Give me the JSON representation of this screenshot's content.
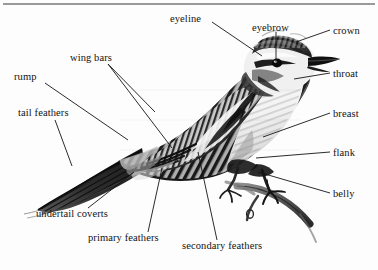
{
  "diagram": {
    "background_color": "#fdfdfd",
    "ink_color": "#131313",
    "top_rule_color": "#9a9a9a",
    "labels": [
      {
        "id": "eyeline",
        "text": "eyeline",
        "x": 170,
        "y": 13,
        "align": "left"
      },
      {
        "id": "eyebrow",
        "text": "eyebrow",
        "x": 252,
        "y": 22,
        "align": "left"
      },
      {
        "id": "crown",
        "text": "crown",
        "x": 333,
        "y": 33,
        "align": "left"
      },
      {
        "id": "throat",
        "text": "throat",
        "x": 333,
        "y": 76,
        "align": "left"
      },
      {
        "id": "breast",
        "text": "breast",
        "x": 333,
        "y": 116,
        "align": "left"
      },
      {
        "id": "flank",
        "text": "flank",
        "x": 333,
        "y": 155,
        "align": "left"
      },
      {
        "id": "belly",
        "text": "belly",
        "x": 333,
        "y": 196,
        "align": "left"
      },
      {
        "id": "wing-bars",
        "text": "wing bars",
        "x": 70,
        "y": 58,
        "align": "left"
      },
      {
        "id": "rump",
        "text": "rump",
        "x": 14,
        "y": 77,
        "align": "left"
      },
      {
        "id": "tail-feathers",
        "text": "tail feathers",
        "x": 18,
        "y": 113,
        "align": "left"
      },
      {
        "id": "undertail-coverts",
        "text": "undertail coverts",
        "x": 36,
        "y": 214,
        "align": "left"
      },
      {
        "id": "primary-feathers",
        "text": "primary feathers",
        "x": 88,
        "y": 238,
        "align": "left"
      },
      {
        "id": "secondary-feathers",
        "text": "secondary feathers",
        "x": 182,
        "y": 246,
        "align": "left"
      }
    ],
    "leader_lines": [
      {
        "id": "leader-eyeline",
        "from": [
          212,
          22
        ],
        "to": [
          262,
          56
        ]
      },
      {
        "id": "leader-eyebrow",
        "from": [
          276,
          32
        ],
        "to": [
          276,
          62
        ]
      },
      {
        "id": "leader-crown",
        "from": [
          330,
          30
        ],
        "to": [
          296,
          42
        ]
      },
      {
        "id": "leader-throat",
        "from": [
          330,
          73
        ],
        "to": [
          294,
          79
        ]
      },
      {
        "id": "leader-breast",
        "from": [
          330,
          113
        ],
        "to": [
          263,
          137
        ]
      },
      {
        "id": "leader-flank",
        "from": [
          330,
          152
        ],
        "to": [
          256,
          158
        ]
      },
      {
        "id": "leader-belly",
        "from": [
          330,
          193
        ],
        "to": [
          258,
          172
        ]
      },
      {
        "id": "leader-wing-bars-a",
        "from": [
          108,
          64
        ],
        "to": [
          155,
          112
        ]
      },
      {
        "id": "leader-wing-bars-b",
        "from": [
          108,
          64
        ],
        "to": [
          172,
          148
        ]
      },
      {
        "id": "leader-rump",
        "from": [
          45,
          83
        ],
        "to": [
          128,
          140
        ]
      },
      {
        "id": "leader-tail-feathers",
        "from": [
          55,
          120
        ],
        "to": [
          72,
          166
        ]
      },
      {
        "id": "leader-undertail-coverts",
        "from": [
          88,
          208
        ],
        "to": [
          134,
          172
        ]
      },
      {
        "id": "leader-primary-feathers",
        "from": [
          148,
          232
        ],
        "to": [
          162,
          168
        ]
      },
      {
        "id": "leader-secondary-feathers",
        "from": [
          217,
          240
        ],
        "to": [
          198,
          152
        ]
      }
    ]
  }
}
